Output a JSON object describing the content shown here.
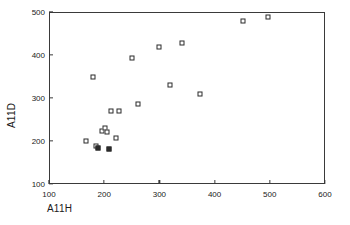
{
  "chart_data": {
    "type": "scatter",
    "title": "",
    "xlabel": "A11H",
    "ylabel": "A11D",
    "xlim": [
      100,
      600
    ],
    "ylim": [
      100,
      500
    ],
    "xticks": [
      100,
      200,
      300,
      400,
      500,
      600
    ],
    "yticks": [
      100,
      200,
      300,
      400,
      500
    ],
    "grid": false,
    "legend": null,
    "marker_style": "open-square",
    "series": [
      {
        "name": "A11D vs A11H",
        "points": [
          {
            "x": 167,
            "y": 200,
            "filled": false
          },
          {
            "x": 185,
            "y": 188,
            "filled": false
          },
          {
            "x": 189,
            "y": 184,
            "filled": true
          },
          {
            "x": 196,
            "y": 223,
            "filled": false
          },
          {
            "x": 201,
            "y": 230,
            "filled": false
          },
          {
            "x": 205,
            "y": 221,
            "filled": false
          },
          {
            "x": 212,
            "y": 270,
            "filled": false
          },
          {
            "x": 227,
            "y": 270,
            "filled": false
          },
          {
            "x": 209,
            "y": 181,
            "filled": true
          },
          {
            "x": 221,
            "y": 207,
            "filled": false
          },
          {
            "x": 180,
            "y": 348,
            "filled": false
          },
          {
            "x": 250,
            "y": 393,
            "filled": false
          },
          {
            "x": 261,
            "y": 285,
            "filled": false
          },
          {
            "x": 299,
            "y": 418,
            "filled": false
          },
          {
            "x": 320,
            "y": 331,
            "filled": false
          },
          {
            "x": 341,
            "y": 427,
            "filled": false
          },
          {
            "x": 374,
            "y": 310,
            "filled": false
          },
          {
            "x": 452,
            "y": 478,
            "filled": false
          },
          {
            "x": 496,
            "y": 488,
            "filled": false
          }
        ]
      }
    ]
  },
  "axes": {
    "x_tick_labels": [
      "100",
      "200",
      "300",
      "400",
      "500",
      "600"
    ],
    "y_tick_labels": [
      "100",
      "200",
      "300",
      "400",
      "500"
    ],
    "x_title": "A11H",
    "y_title": "A11D"
  },
  "style": {
    "marker_edge_color": "#2b2b2b",
    "marker_face_color": "#ffffff",
    "axis_color": "#3a3a3a",
    "text_color": "#1a1a1a",
    "background": "#ffffff"
  }
}
